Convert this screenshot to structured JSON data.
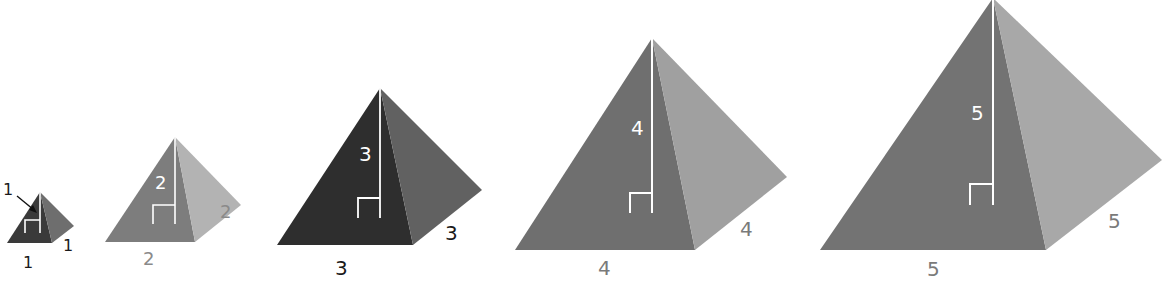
{
  "colors": {
    "background": "#ffffff",
    "marker": "#ffffff",
    "label_dark": "#1a1a1a",
    "label_gray": "#7a7a7a"
  },
  "pyramids": [
    {
      "id": "pyramid-1",
      "height_label": "1",
      "base_front_label": "1",
      "base_side_label": "1",
      "front_color": "#3a3a3a",
      "side_color": "#6e6e6e",
      "label_color": "#1a1a1a",
      "height_label_outside": true
    },
    {
      "id": "pyramid-2",
      "height_label": "2",
      "base_front_label": "2",
      "base_side_label": "2",
      "front_color": "#7d7d7d",
      "side_color": "#b3b3b3",
      "label_color": "#8a8a8a",
      "height_label_outside": false
    },
    {
      "id": "pyramid-3",
      "height_label": "3",
      "base_front_label": "3",
      "base_side_label": "3",
      "front_color": "#2e2e2e",
      "side_color": "#616161",
      "label_color": "#1a1a1a",
      "height_label_outside": false
    },
    {
      "id": "pyramid-4",
      "height_label": "4",
      "base_front_label": "4",
      "base_side_label": "4",
      "front_color": "#6f6f6f",
      "side_color": "#a0a0a0",
      "label_color": "#7a7a7a",
      "height_label_outside": false
    },
    {
      "id": "pyramid-5",
      "height_label": "5",
      "base_front_label": "5",
      "base_side_label": "5",
      "front_color": "#737373",
      "side_color": "#a8a8a8",
      "label_color": "#7a7a7a",
      "height_label_outside": false
    }
  ]
}
